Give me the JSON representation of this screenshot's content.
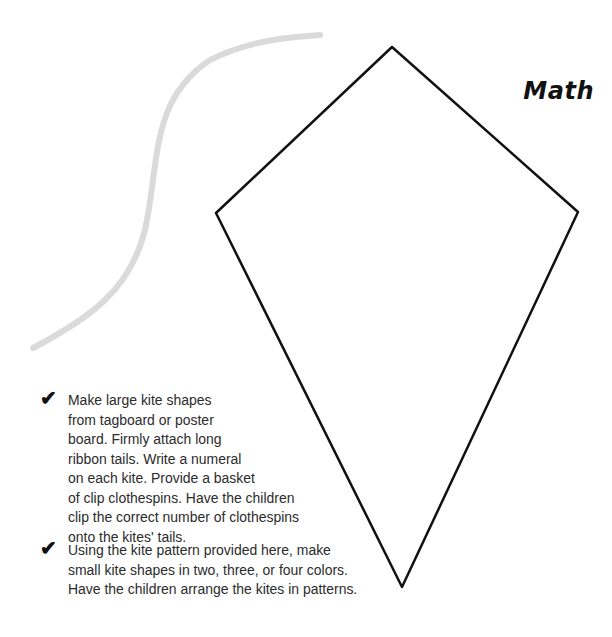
{
  "title": "Math",
  "items": [
    {
      "icon": "checkmark-icon",
      "text": "Make large kite shapes\nfrom tagboard or poster\nboard. Firmly attach long\nribbon tails. Write a numeral\non each kite. Provide a basket\nof clip clothespins. Have the children\nclip the correct number of clothespins\nonto the kites' tails."
    },
    {
      "icon": "checkmark-icon",
      "text": "Using the kite pattern provided here, make\nsmall kite shapes in two, three, or four colors.\nHave the children arrange the kites in patterns."
    }
  ],
  "illustration": {
    "kite": {
      "top": [
        392,
        47
      ],
      "right": [
        578,
        212
      ],
      "bottom": [
        402,
        587
      ],
      "left": [
        216,
        213
      ],
      "stroke": "#111111"
    },
    "tail": {
      "color": "#d9d9d9"
    }
  },
  "checkmark": "✔"
}
